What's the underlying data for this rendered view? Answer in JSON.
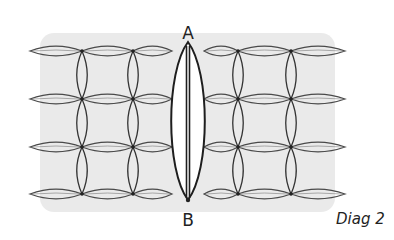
{
  "diagram": {
    "point_labels": {
      "top": "A",
      "bottom": "B"
    },
    "caption": "Diag 2",
    "grid": {
      "rows_y": [
        51,
        99,
        147,
        194
      ],
      "node_columns_x": [
        82,
        133,
        238,
        291
      ],
      "left_edge_x": 30,
      "right_edge_x": 345
    },
    "central_stitch": {
      "center_x": 188,
      "top_y": 42,
      "bottom_y": 200,
      "half_width": 16
    },
    "colors": {
      "stroke": "#333333",
      "shading": "#d8d8d8",
      "background": "#ffffff"
    }
  }
}
